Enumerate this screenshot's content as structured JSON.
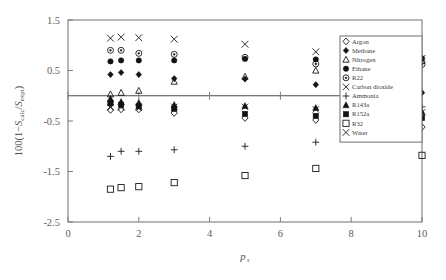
{
  "chart_data": {
    "type": "scatter",
    "title": "",
    "xlabel": "p_r",
    "ylabel": "100(1-S_calc/S_expt)",
    "xlim": [
      0,
      10
    ],
    "ylim": [
      -2.5,
      1.5
    ],
    "xticks": [
      "0",
      "2",
      "4",
      "6",
      "8",
      "10"
    ],
    "xtick_values": [
      0,
      2,
      4,
      6,
      8,
      10
    ],
    "yticks": [
      "1.5",
      "0.5",
      "-0.5",
      "-1.5",
      "-2.5"
    ],
    "ytick_values": [
      1.5,
      0.5,
      -0.5,
      -1.5,
      -2.5
    ],
    "grid": false,
    "reference_line_y": 0,
    "legend_position": "top-right",
    "series": [
      {
        "name": "Argon",
        "marker": "open-diamond",
        "points": [
          {
            "x": 1.2,
            "y": -0.28
          },
          {
            "x": 1.5,
            "y": -0.27
          },
          {
            "x": 2.0,
            "y": -0.27
          },
          {
            "x": 3.0,
            "y": -0.34
          },
          {
            "x": 5.0,
            "y": -0.44
          },
          {
            "x": 7.0,
            "y": -0.48
          },
          {
            "x": 10.0,
            "y": -0.62
          }
        ]
      },
      {
        "name": "Methane",
        "marker": "filled-diamond",
        "points": [
          {
            "x": 1.2,
            "y": 0.42
          },
          {
            "x": 1.5,
            "y": 0.46
          },
          {
            "x": 2.0,
            "y": 0.42
          },
          {
            "x": 3.0,
            "y": 0.34
          },
          {
            "x": 5.0,
            "y": 0.33
          },
          {
            "x": 7.0,
            "y": 0.22
          },
          {
            "x": 10.0,
            "y": 0.06
          }
        ]
      },
      {
        "name": "Nitrogen",
        "marker": "open-triangle",
        "points": [
          {
            "x": 1.2,
            "y": 0.03
          },
          {
            "x": 1.5,
            "y": 0.06
          },
          {
            "x": 2.0,
            "y": 0.1
          },
          {
            "x": 3.0,
            "y": 0.28
          },
          {
            "x": 5.0,
            "y": 0.38
          },
          {
            "x": 7.0,
            "y": 0.5
          },
          {
            "x": 10.0,
            "y": 0.69
          }
        ]
      },
      {
        "name": "Ethane",
        "marker": "filled-circle",
        "points": [
          {
            "x": 1.2,
            "y": 0.68
          },
          {
            "x": 1.5,
            "y": 0.7
          },
          {
            "x": 2.0,
            "y": 0.7
          },
          {
            "x": 3.0,
            "y": 0.7
          },
          {
            "x": 5.0,
            "y": 0.73
          },
          {
            "x": 7.0,
            "y": 0.72
          },
          {
            "x": 10.0,
            "y": 0.74
          }
        ]
      },
      {
        "name": "R22",
        "marker": "open-circle-dot",
        "points": [
          {
            "x": 1.2,
            "y": 0.9
          },
          {
            "x": 1.5,
            "y": 0.9
          },
          {
            "x": 2.0,
            "y": 0.84
          },
          {
            "x": 3.0,
            "y": 0.82
          },
          {
            "x": 5.0,
            "y": 0.76
          },
          {
            "x": 7.0,
            "y": 0.63
          },
          {
            "x": 10.0,
            "y": 0.62
          }
        ]
      },
      {
        "name": "Carbon dioxide",
        "marker": "bold-x",
        "points": [
          {
            "x": 1.2,
            "y": -0.23
          },
          {
            "x": 1.5,
            "y": -0.23
          },
          {
            "x": 2.0,
            "y": -0.24
          },
          {
            "x": 3.0,
            "y": -0.22
          },
          {
            "x": 5.0,
            "y": -0.22
          },
          {
            "x": 7.0,
            "y": -0.27
          },
          {
            "x": 10.0,
            "y": -0.33
          }
        ]
      },
      {
        "name": "Ammonia",
        "marker": "plus",
        "points": [
          {
            "x": 1.2,
            "y": -1.2
          },
          {
            "x": 1.5,
            "y": -1.1
          },
          {
            "x": 2.0,
            "y": -1.1
          },
          {
            "x": 3.0,
            "y": -1.07
          },
          {
            "x": 5.0,
            "y": -1.0
          },
          {
            "x": 7.0,
            "y": -0.92
          },
          {
            "x": 10.0,
            "y": -0.22
          }
        ]
      },
      {
        "name": "R143a",
        "marker": "filled-triangle",
        "points": [
          {
            "x": 1.2,
            "y": -0.06
          },
          {
            "x": 1.5,
            "y": -0.12
          },
          {
            "x": 2.0,
            "y": -0.14
          },
          {
            "x": 3.0,
            "y": -0.18
          },
          {
            "x": 5.0,
            "y": -0.2
          },
          {
            "x": 7.0,
            "y": -0.24
          },
          {
            "x": 10.0,
            "y": -0.32
          }
        ]
      },
      {
        "name": "R152a",
        "marker": "filled-square",
        "points": [
          {
            "x": 1.2,
            "y": -0.15
          },
          {
            "x": 1.5,
            "y": -0.18
          },
          {
            "x": 2.0,
            "y": -0.21
          },
          {
            "x": 3.0,
            "y": -0.26
          },
          {
            "x": 5.0,
            "y": -0.36
          },
          {
            "x": 7.0,
            "y": -0.4
          },
          {
            "x": 10.0,
            "y": -0.44
          }
        ]
      },
      {
        "name": "R32",
        "marker": "open-square",
        "points": [
          {
            "x": 1.2,
            "y": -1.85
          },
          {
            "x": 1.5,
            "y": -1.82
          },
          {
            "x": 2.0,
            "y": -1.8
          },
          {
            "x": 3.0,
            "y": -1.72
          },
          {
            "x": 5.0,
            "y": -1.58
          },
          {
            "x": 7.0,
            "y": -1.44
          },
          {
            "x": 10.0,
            "y": -1.18
          }
        ]
      },
      {
        "name": "Water",
        "marker": "thin-x",
        "points": [
          {
            "x": 1.2,
            "y": 1.14
          },
          {
            "x": 1.5,
            "y": 1.16
          },
          {
            "x": 2.0,
            "y": 1.15
          },
          {
            "x": 3.0,
            "y": 1.12
          },
          {
            "x": 5.0,
            "y": 1.02
          },
          {
            "x": 7.0,
            "y": 0.87
          },
          {
            "x": 10.0,
            "y": 0.74
          }
        ]
      }
    ],
    "legend_entries": [
      "Argon",
      "Methane",
      "Nitrogen",
      "Ethane",
      "R22",
      "Carbon dioxide",
      "Ammonia",
      "R143a",
      "R152a",
      "R32",
      "Water"
    ]
  },
  "colors": {
    "marker": "#121212",
    "axis": "#7d7d7d",
    "text": "#4d4d4d",
    "background": "#ffffff"
  }
}
